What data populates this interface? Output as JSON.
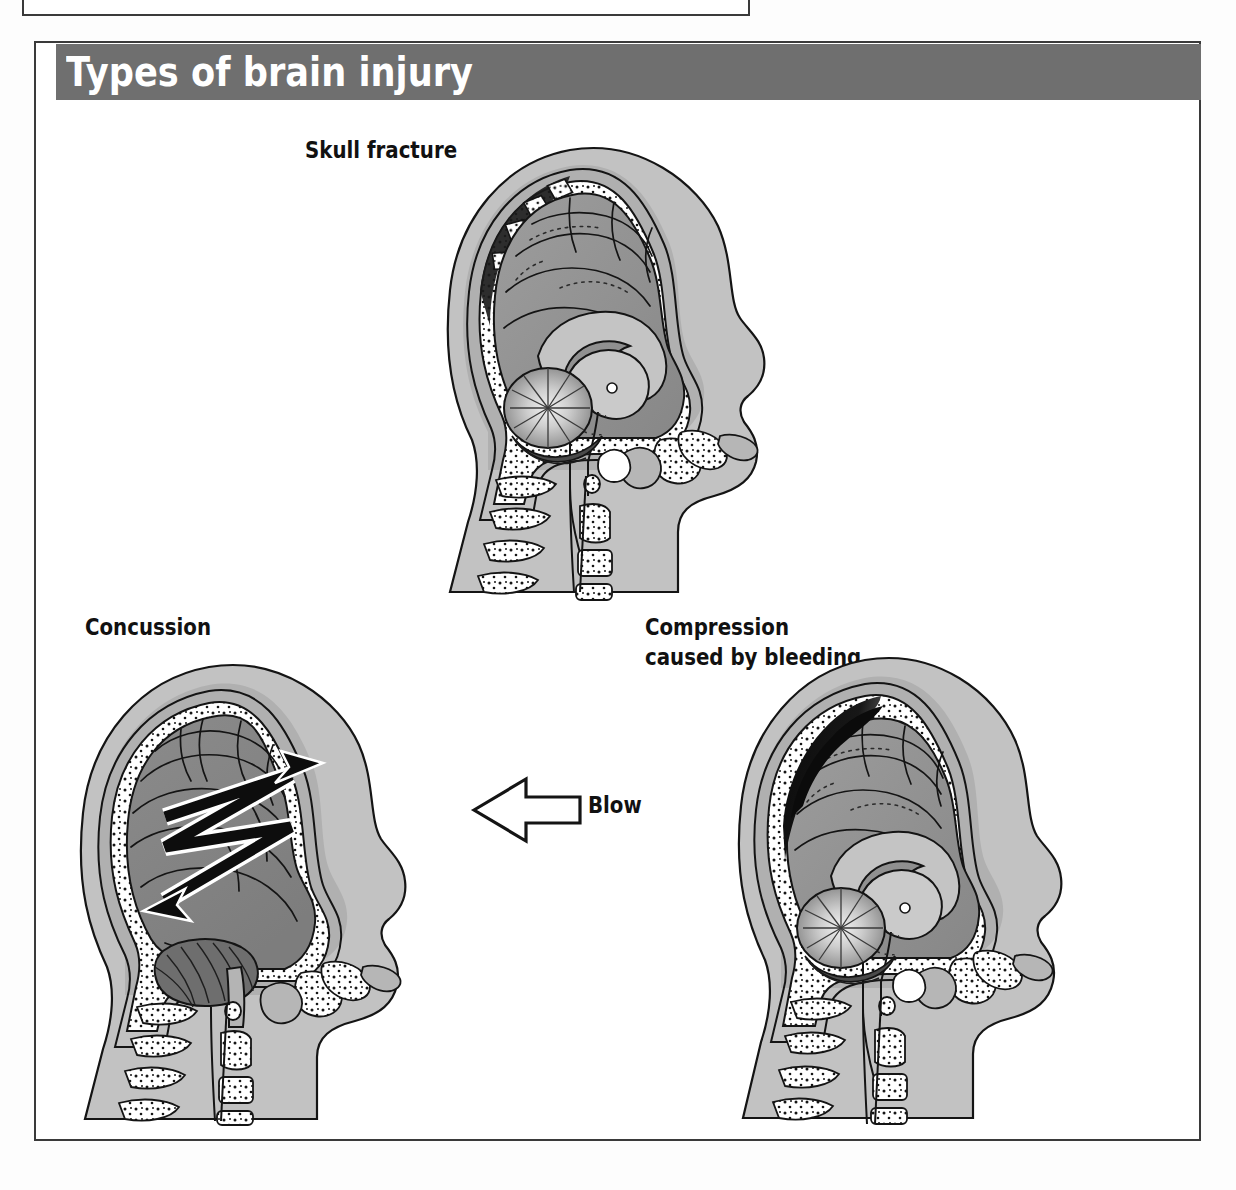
{
  "page": {
    "background_color": "#ffffff",
    "panel_border_color": "#3a3a3a"
  },
  "banner": {
    "title": "Types of brain injury",
    "background_color": "#6f6f6f",
    "text_color": "#ffffff"
  },
  "figures": [
    {
      "id": "skull-fracture",
      "label": "Skull fracture",
      "view": "sagittal-section",
      "feature": "depressed skull fracture with displaced bone fragments and dark shadow at upper-left vault"
    },
    {
      "id": "concussion",
      "label": "Concussion",
      "view": "lateral-whole-brain",
      "feature": "black double-headed zigzag arrow showing brain moving back and forth inside skull"
    },
    {
      "id": "compression",
      "label_line1": "Compression",
      "label_line2": "caused by bleeding",
      "view": "sagittal-section",
      "feature": "black lens-shaped haematoma between skull and brain at upper-left compressing brain"
    }
  ],
  "annotations": {
    "blow_label": "Blow",
    "blow_arrow_direction": "left"
  },
  "palette": {
    "scalp_light": "#c8c8c8",
    "scalp_mid": "#b5b5b5",
    "skull_bone": "#ffffff",
    "bone_stipple": "#1a1a1a",
    "cortex_dark": "#8d8d8d",
    "cortex_mid": "#9b9b9b",
    "inner_structure": "#bdbdbd",
    "cerebellum_dark": "#6b6b6b",
    "haemorrhage": "#121212",
    "outline": "#141414",
    "arrow_fill": "#ffffff",
    "zigzag_arrow": "#0d0d0d"
  }
}
